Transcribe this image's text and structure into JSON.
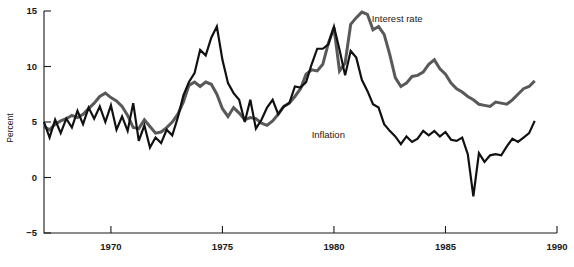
{
  "chart_data": {
    "type": "line",
    "title": "",
    "subtitle": "",
    "xlabel": "",
    "ylabel": "Percent",
    "xlim": [
      1967.0,
      1990.0
    ],
    "ylim": [
      -5,
      15
    ],
    "xticks": [
      1970,
      1975,
      1980,
      1985,
      1990
    ],
    "xtick_labels": [
      "1970",
      "1975",
      "1980",
      "1985",
      "1990"
    ],
    "yticks": [
      -5,
      0,
      5,
      10,
      15
    ],
    "ytick_labels": [
      "−5",
      "0",
      "5",
      "10",
      "15"
    ],
    "grid": false,
    "legend_position": "inline-annotation",
    "annotations": [
      {
        "text": "Interest rate",
        "x": 1981.7,
        "y": 14.0
      },
      {
        "text": "Inflation",
        "x": 1979.0,
        "y": 3.6
      }
    ],
    "series": [
      {
        "name": "Interest rate",
        "color": "#595959",
        "width": 3.0,
        "x": [
          1967.0,
          1967.25,
          1967.5,
          1967.75,
          1968.0,
          1968.25,
          1968.5,
          1968.75,
          1969.0,
          1969.25,
          1969.5,
          1969.75,
          1970.0,
          1970.25,
          1970.5,
          1970.75,
          1971.0,
          1971.25,
          1971.5,
          1971.75,
          1972.0,
          1972.25,
          1972.5,
          1972.75,
          1973.0,
          1973.25,
          1973.5,
          1973.75,
          1974.0,
          1974.25,
          1974.5,
          1974.75,
          1975.0,
          1975.25,
          1975.5,
          1975.75,
          1976.0,
          1976.25,
          1976.5,
          1976.75,
          1977.0,
          1977.25,
          1977.5,
          1977.75,
          1978.0,
          1978.25,
          1978.5,
          1978.75,
          1979.0,
          1979.25,
          1979.5,
          1979.75,
          1980.0,
          1980.25,
          1980.5,
          1980.75,
          1981.0,
          1981.25,
          1981.5,
          1981.75,
          1982.0,
          1982.25,
          1982.5,
          1982.75,
          1983.0,
          1983.25,
          1983.5,
          1983.75,
          1984.0,
          1984.25,
          1984.5,
          1984.75,
          1985.0,
          1985.25,
          1985.5,
          1985.75,
          1986.0,
          1986.25,
          1986.5,
          1986.75,
          1987.0,
          1987.25,
          1987.5,
          1987.75,
          1988.0,
          1988.25,
          1988.5,
          1988.75,
          1989.0
        ],
        "y": [
          4.6,
          4.3,
          4.8,
          5.1,
          5.3,
          5.6,
          5.4,
          5.7,
          6.2,
          6.7,
          7.3,
          7.6,
          7.2,
          6.9,
          6.4,
          5.6,
          4.5,
          4.4,
          5.2,
          4.6,
          4.0,
          4.1,
          4.5,
          5.0,
          5.7,
          6.8,
          8.3,
          8.6,
          8.2,
          8.6,
          8.4,
          7.5,
          6.2,
          5.5,
          6.3,
          5.8,
          5.2,
          5.4,
          5.3,
          4.9,
          4.7,
          5.1,
          5.7,
          6.4,
          6.7,
          7.3,
          8.0,
          9.3,
          9.7,
          9.6,
          10.2,
          12.1,
          13.5,
          9.6,
          10.3,
          13.8,
          14.4,
          14.9,
          14.7,
          13.3,
          13.6,
          12.9,
          11.1,
          9.0,
          8.2,
          8.5,
          9.1,
          9.2,
          9.5,
          10.2,
          10.6,
          9.8,
          9.3,
          8.5,
          8.0,
          7.7,
          7.3,
          7.0,
          6.6,
          6.5,
          6.4,
          6.8,
          6.7,
          6.6,
          7.0,
          7.5,
          8.0,
          8.2,
          8.7
        ]
      },
      {
        "name": "Inflation",
        "color": "#111111",
        "width": 2.2,
        "x": [
          1967.0,
          1967.25,
          1967.5,
          1967.75,
          1968.0,
          1968.25,
          1968.5,
          1968.75,
          1969.0,
          1969.25,
          1969.5,
          1969.75,
          1970.0,
          1970.25,
          1970.5,
          1970.75,
          1971.0,
          1971.25,
          1971.5,
          1971.75,
          1972.0,
          1972.25,
          1972.5,
          1972.75,
          1973.0,
          1973.25,
          1973.5,
          1973.75,
          1974.0,
          1974.25,
          1974.5,
          1974.75,
          1975.0,
          1975.25,
          1975.5,
          1975.75,
          1976.0,
          1976.25,
          1976.5,
          1976.75,
          1977.0,
          1977.25,
          1977.5,
          1977.75,
          1978.0,
          1978.25,
          1978.5,
          1978.75,
          1979.0,
          1979.25,
          1979.5,
          1979.75,
          1980.0,
          1980.25,
          1980.5,
          1980.75,
          1981.0,
          1981.25,
          1981.5,
          1981.75,
          1982.0,
          1982.25,
          1982.5,
          1982.75,
          1983.0,
          1983.25,
          1983.5,
          1983.75,
          1984.0,
          1984.25,
          1984.5,
          1984.75,
          1985.0,
          1985.25,
          1985.5,
          1985.75,
          1986.0,
          1986.25,
          1986.5,
          1986.75,
          1987.0,
          1987.25,
          1987.5,
          1987.75,
          1988.0,
          1988.25,
          1988.5,
          1988.75,
          1989.0
        ],
        "y": [
          5.0,
          3.6,
          5.2,
          4.0,
          5.3,
          4.5,
          6.0,
          4.8,
          6.3,
          5.3,
          6.4,
          5.0,
          6.5,
          4.3,
          5.5,
          4.2,
          6.7,
          3.3,
          4.7,
          2.7,
          3.6,
          3.1,
          4.3,
          3.8,
          5.4,
          7.4,
          8.6,
          9.4,
          11.5,
          11.0,
          12.6,
          13.6,
          10.6,
          8.5,
          7.6,
          7.0,
          5.0,
          7.0,
          4.4,
          5.2,
          6.3,
          7.0,
          5.7,
          6.4,
          6.7,
          8.2,
          8.1,
          8.6,
          10.2,
          11.6,
          11.6,
          12.0,
          13.6,
          11.5,
          9.2,
          11.4,
          10.8,
          8.8,
          7.8,
          6.6,
          6.3,
          4.8,
          4.2,
          3.7,
          3.0,
          3.7,
          3.2,
          3.5,
          4.2,
          3.8,
          4.2,
          3.7,
          4.1,
          3.4,
          3.3,
          3.6,
          2.1,
          -1.7,
          2.2,
          1.4,
          2.0,
          2.1,
          2.0,
          2.8,
          3.5,
          3.2,
          3.6,
          4.0,
          5.1
        ]
      }
    ]
  },
  "axis": {
    "y_title": "Percent"
  }
}
